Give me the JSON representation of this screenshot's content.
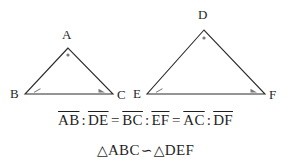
{
  "figure": {
    "background_color": "#ffffff",
    "stroke_color": "#2b2b2b",
    "angle_mark_color": "#6e6e6e",
    "triangles": [
      {
        "name": "triangle-abc",
        "vertices": [
          {
            "label": "A",
            "x": 68,
            "y": 48,
            "label_x": 62,
            "label_y": 28
          },
          {
            "label": "B",
            "x": 25,
            "y": 94,
            "label_x": 10,
            "label_y": 87
          },
          {
            "label": "C",
            "x": 113,
            "y": 94,
            "label_x": 117,
            "label_y": 88
          }
        ]
      },
      {
        "name": "triangle-def",
        "vertices": [
          {
            "label": "D",
            "x": 204,
            "y": 30,
            "label_x": 198,
            "label_y": 8
          },
          {
            "label": "E",
            "x": 147,
            "y": 94,
            "label_x": 133,
            "label_y": 87
          },
          {
            "label": "F",
            "x": 265,
            "y": 94,
            "label_x": 269,
            "label_y": 88
          }
        ]
      }
    ]
  },
  "ratio_equation": {
    "name": "side-ratio-equation",
    "plain_text": "AB : DE = BC : EF = AC : DF",
    "terms": [
      {
        "segment": "AB"
      },
      {
        "segment": "DE"
      },
      {
        "segment": "BC"
      },
      {
        "segment": "EF"
      },
      {
        "segment": "AC"
      },
      {
        "segment": "DF"
      }
    ],
    "colon": ":",
    "equals": "="
  },
  "similarity_statement": {
    "name": "similarity-statement",
    "plain_text": "△ABC ∽ △DEF",
    "triangle_symbol": "△",
    "first_triangle": "ABC",
    "similar_symbol": "∽",
    "second_triangle": "DEF"
  }
}
